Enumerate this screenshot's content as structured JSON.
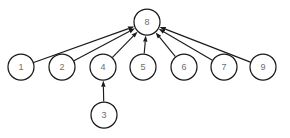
{
  "diagram": {
    "background_color": "#ffffff",
    "node_fill": "#ffffff",
    "node_stroke": "#1a1a1a",
    "label_color": "#6e6e6e",
    "edge_color": "#1a1a1a",
    "node_radius": 13,
    "width": 290,
    "height": 138,
    "nodes": [
      {
        "id": "n1",
        "label": "1",
        "cx": 21,
        "cy": 67,
        "r": 13
      },
      {
        "id": "n2",
        "label": "2",
        "cx": 62,
        "cy": 67,
        "r": 13
      },
      {
        "id": "n3",
        "label": "3",
        "cx": 104,
        "cy": 115,
        "r": 13
      },
      {
        "id": "n4",
        "label": "4",
        "cx": 103,
        "cy": 67,
        "r": 13
      },
      {
        "id": "n5",
        "label": "5",
        "cx": 143,
        "cy": 67,
        "r": 13
      },
      {
        "id": "n6",
        "label": "6",
        "cx": 184,
        "cy": 67,
        "r": 13
      },
      {
        "id": "n7",
        "label": "7",
        "cx": 224,
        "cy": 67,
        "r": 13
      },
      {
        "id": "n8",
        "label": "8",
        "cx": 147,
        "cy": 22,
        "r": 13
      },
      {
        "id": "n9",
        "label": "9",
        "cx": 263,
        "cy": 67,
        "r": 13
      }
    ],
    "edges": [
      {
        "from": "n1",
        "to": "n8",
        "directed": true
      },
      {
        "from": "n2",
        "to": "n8",
        "directed": true
      },
      {
        "from": "n4",
        "to": "n8",
        "directed": true
      },
      {
        "from": "n5",
        "to": "n8",
        "directed": true
      },
      {
        "from": "n6",
        "to": "n8",
        "directed": true
      },
      {
        "from": "n7",
        "to": "n8",
        "directed": true
      },
      {
        "from": "n9",
        "to": "n8",
        "directed": true
      },
      {
        "from": "n3",
        "to": "n4",
        "directed": true
      }
    ]
  }
}
